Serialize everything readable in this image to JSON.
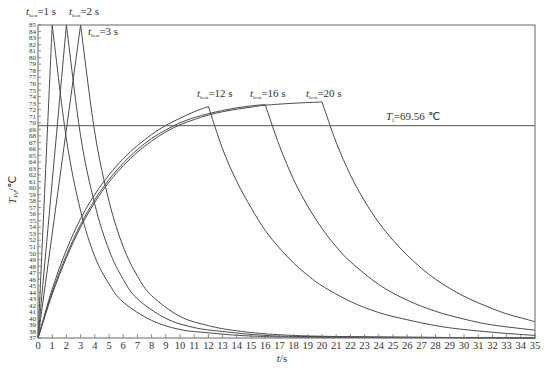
{
  "chart_data": {
    "type": "line",
    "title": "",
    "xlabel": "t/s",
    "ylabel": "T_Pd/℃",
    "xlim": [
      0,
      35
    ],
    "ylim": [
      37,
      85
    ],
    "x_ticks": [
      0,
      1,
      2,
      3,
      4,
      5,
      6,
      7,
      8,
      9,
      10,
      11,
      12,
      13,
      14,
      15,
      16,
      17,
      18,
      19,
      20,
      21,
      22,
      23,
      24,
      25,
      26,
      27,
      28,
      29,
      30,
      31,
      32,
      33,
      34,
      35
    ],
    "y_ticks": [
      37,
      38,
      39,
      40,
      41,
      42,
      43,
      44,
      45,
      46,
      47,
      48,
      49,
      50,
      51,
      52,
      53,
      54,
      55,
      56,
      57,
      58,
      59,
      60,
      61,
      62,
      63,
      64,
      65,
      66,
      67,
      68,
      69,
      70,
      71,
      72,
      73,
      74,
      75,
      76,
      77,
      78,
      79,
      80,
      81,
      82,
      83,
      84,
      85
    ],
    "grid": false,
    "reference_line": {
      "label": "T_i=69.56 ℃",
      "y": 69.56
    },
    "series": [
      {
        "name": "t_heat=1 s",
        "heat_time": 1,
        "peak": 85,
        "points": [
          [
            0,
            37
          ],
          [
            1,
            85
          ],
          [
            2,
            67.5
          ],
          [
            3,
            56.5
          ],
          [
            4,
            49.5
          ],
          [
            5,
            45.3
          ],
          [
            6,
            42.5
          ],
          [
            8,
            39.7
          ],
          [
            10,
            38.3
          ],
          [
            12,
            37.8
          ],
          [
            15,
            37.3
          ],
          [
            20,
            37.1
          ],
          [
            35,
            37.0
          ]
        ]
      },
      {
        "name": "t_heat=2 s",
        "heat_time": 2,
        "peak": 85,
        "points": [
          [
            0,
            37
          ],
          [
            2,
            85
          ],
          [
            3,
            68
          ],
          [
            4,
            57.5
          ],
          [
            5,
            50.5
          ],
          [
            6,
            46
          ],
          [
            7,
            43
          ],
          [
            9,
            40
          ],
          [
            11,
            38.6
          ],
          [
            13,
            38
          ],
          [
            16,
            37.4
          ],
          [
            20,
            37.2
          ],
          [
            35,
            37.0
          ]
        ]
      },
      {
        "name": "t_heat=3 s",
        "heat_time": 3,
        "peak": 85,
        "points": [
          [
            0,
            37
          ],
          [
            3,
            85
          ],
          [
            4,
            68.5
          ],
          [
            5,
            58
          ],
          [
            6,
            51
          ],
          [
            7,
            46.5
          ],
          [
            8,
            43.5
          ],
          [
            10,
            40.3
          ],
          [
            12,
            38.9
          ],
          [
            14,
            38.1
          ],
          [
            17,
            37.5
          ],
          [
            22,
            37.2
          ],
          [
            35,
            37.0
          ]
        ]
      },
      {
        "name": "t_heat=12 s",
        "heat_time": 12,
        "peak": 72.5,
        "points": [
          [
            0,
            37
          ],
          [
            1,
            44.5
          ],
          [
            2,
            50.5
          ],
          [
            3,
            55.3
          ],
          [
            4,
            59
          ],
          [
            5,
            62
          ],
          [
            6,
            64.5
          ],
          [
            7,
            66.5
          ],
          [
            8,
            68.2
          ],
          [
            9,
            69.6
          ],
          [
            10,
            70.7
          ],
          [
            11,
            71.7
          ],
          [
            12,
            72.5
          ],
          [
            13,
            66
          ],
          [
            14,
            61
          ],
          [
            15,
            57
          ],
          [
            16,
            53.5
          ],
          [
            17,
            50.8
          ],
          [
            18,
            48.5
          ],
          [
            19,
            46.6
          ],
          [
            20,
            45
          ],
          [
            22,
            42.6
          ],
          [
            24,
            40.9
          ],
          [
            26,
            39.8
          ],
          [
            28,
            38.9
          ],
          [
            30,
            38.3
          ],
          [
            33,
            37.7
          ],
          [
            35,
            37.4
          ]
        ]
      },
      {
        "name": "t_heat=16 s",
        "heat_time": 16,
        "peak": 72.8,
        "points": [
          [
            0,
            37
          ],
          [
            1,
            44
          ],
          [
            2,
            49.7
          ],
          [
            3,
            54.4
          ],
          [
            4,
            58.2
          ],
          [
            5,
            61.3
          ],
          [
            6,
            63.8
          ],
          [
            7,
            65.9
          ],
          [
            8,
            67.6
          ],
          [
            9,
            68.9
          ],
          [
            10,
            70
          ],
          [
            11,
            70.8
          ],
          [
            12,
            71.4
          ],
          [
            13,
            71.9
          ],
          [
            14,
            72.3
          ],
          [
            15,
            72.6
          ],
          [
            16,
            72.8
          ],
          [
            17,
            66.5
          ],
          [
            18,
            61.3
          ],
          [
            19,
            57.2
          ],
          [
            20,
            53.8
          ],
          [
            21,
            51
          ],
          [
            22,
            48.7
          ],
          [
            24,
            45.2
          ],
          [
            26,
            42.8
          ],
          [
            28,
            41.1
          ],
          [
            30,
            39.9
          ],
          [
            32,
            39
          ],
          [
            35,
            38.2
          ]
        ]
      },
      {
        "name": "t_heat=20 s",
        "heat_time": 20,
        "peak": 73.2,
        "points": [
          [
            0,
            37
          ],
          [
            1,
            43.7
          ],
          [
            2,
            49.3
          ],
          [
            3,
            54
          ],
          [
            4,
            57.8
          ],
          [
            5,
            60.9
          ],
          [
            6,
            63.4
          ],
          [
            7,
            65.5
          ],
          [
            8,
            67.2
          ],
          [
            9,
            68.6
          ],
          [
            10,
            69.7
          ],
          [
            11,
            70.5
          ],
          [
            12,
            71.2
          ],
          [
            13,
            71.7
          ],
          [
            14,
            72.1
          ],
          [
            15,
            72.4
          ],
          [
            16,
            72.7
          ],
          [
            18,
            73
          ],
          [
            20,
            73.2
          ],
          [
            21,
            67
          ],
          [
            22,
            62
          ],
          [
            23,
            58
          ],
          [
            24,
            54.7
          ],
          [
            25,
            52
          ],
          [
            26,
            49.7
          ],
          [
            27,
            47.7
          ],
          [
            28,
            46
          ],
          [
            29,
            44.6
          ],
          [
            30,
            43.4
          ],
          [
            31,
            42.4
          ],
          [
            32,
            41.5
          ],
          [
            33,
            40.7
          ],
          [
            34,
            40.1
          ],
          [
            35,
            39.5
          ]
        ]
      }
    ],
    "annotations": [
      {
        "text": "t_heat=1 s",
        "x": 1,
        "y": 85
      },
      {
        "text": "t_heat=2 s",
        "x": 2,
        "y": 85
      },
      {
        "text": "t_heat=3 s",
        "x": 3,
        "y": 84
      },
      {
        "text": "t_heat=12 s",
        "x": 12,
        "y": 73.5
      },
      {
        "text": "t_heat=16 s",
        "x": 16,
        "y": 73.5
      },
      {
        "text": "t_heat=20 s",
        "x": 20,
        "y": 73.5
      },
      {
        "text": "T_i=69.56 ℃",
        "x": 27,
        "y": 70.5
      }
    ]
  },
  "labels": {
    "t_sym": "t",
    "t_sub": "heat",
    "l1_val": "=1 s",
    "l2_val": "=2 s",
    "l3_val": "=3 s",
    "l12_val": "=12 s",
    "l16_val": "=16 s",
    "l20_val": "=20 s",
    "ti_sym": "T",
    "ti_sub": "i",
    "ti_val": "=69.56 ℃",
    "ylabel_sym": "T",
    "ylabel_sub": "Pd",
    "ylabel_unit": "/℃",
    "xlabel_sym": "t",
    "xlabel_unit": "/s"
  },
  "colors": {
    "axis": "#555555",
    "curve": "#4a4a4a",
    "text": "#333333"
  }
}
